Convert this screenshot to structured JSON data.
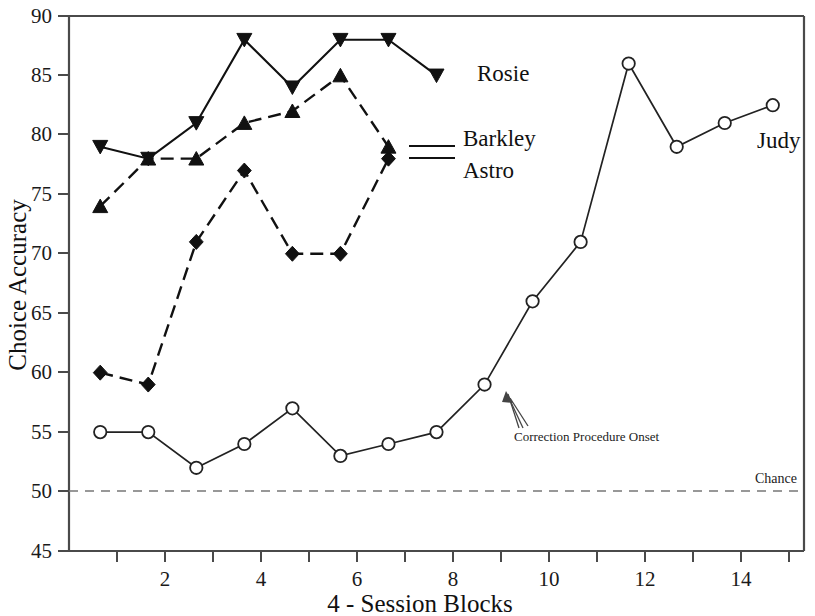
{
  "chart_data": {
    "type": "line",
    "title": "",
    "xlabel": "4 - Session Blocks",
    "ylabel": "Choice Accuracy",
    "xlim": [
      0.35,
      15.65
    ],
    "ylim": [
      45,
      90
    ],
    "grid": false,
    "legend_position": "inline-right-of-series",
    "x_ticks_major": [
      2,
      4,
      6,
      8,
      10,
      12,
      14
    ],
    "x_ticks_minor": [
      1,
      3,
      5,
      7,
      9,
      11,
      13,
      15
    ],
    "y_ticks": [
      45,
      50,
      55,
      60,
      65,
      70,
      75,
      80,
      85,
      90
    ],
    "series": [
      {
        "name": "Rosie",
        "marker": "triangle-down-filled",
        "linestyle": "solid",
        "x": [
          1,
          2,
          3,
          4,
          5,
          6,
          7,
          8
        ],
        "values": [
          79,
          78,
          81,
          88,
          84,
          88,
          88,
          85
        ]
      },
      {
        "name": "Barkley",
        "marker": "triangle-up-filled",
        "linestyle": "dashed",
        "x": [
          1,
          2,
          3,
          4,
          5,
          6,
          7
        ],
        "values": [
          74,
          78,
          78,
          81,
          82,
          85,
          79
        ]
      },
      {
        "name": "Astro",
        "marker": "diamond-filled",
        "linestyle": "dashed",
        "x": [
          1,
          2,
          3,
          4,
          5,
          6,
          7
        ],
        "values": [
          60,
          59,
          71,
          77,
          70,
          70,
          78
        ]
      },
      {
        "name": "Judy",
        "marker": "circle-open",
        "linestyle": "solid",
        "x": [
          1,
          2,
          3,
          4,
          5,
          6,
          7,
          8,
          9,
          10,
          11,
          12,
          13,
          14,
          15
        ],
        "values": [
          55,
          55,
          52,
          54,
          57,
          53,
          54,
          55,
          59,
          66,
          71,
          86,
          79,
          81,
          82.5
        ]
      }
    ],
    "reference_lines": [
      {
        "name": "Chance",
        "axis": "y",
        "value": 50,
        "label": "Chance",
        "style": "dashed"
      }
    ],
    "annotations": [
      {
        "text": "Correction Procedure Onset",
        "points_to_series": "Judy",
        "points_to_x": 9,
        "points_to_y": 59
      }
    ]
  },
  "axes": {
    "y_title": "Choice Accuracy",
    "x_title": "4 - Session Blocks",
    "y_tick_labels": [
      "90",
      "85",
      "80",
      "75",
      "70",
      "65",
      "60",
      "55",
      "50",
      "45"
    ],
    "x_tick_labels": [
      "2",
      "4",
      "6",
      "8",
      "10",
      "12",
      "14"
    ]
  },
  "series_labels": {
    "rosie": "Rosie",
    "barkley": "Barkley",
    "astro": "Astro",
    "judy": "Judy"
  },
  "annotation_labels": {
    "correction": "Correction Procedure Onset",
    "chance": "Chance"
  },
  "colors": {
    "ink": "#111111",
    "axis": "#4a4a4a",
    "chance": "#777777",
    "background": "#ffffff"
  }
}
